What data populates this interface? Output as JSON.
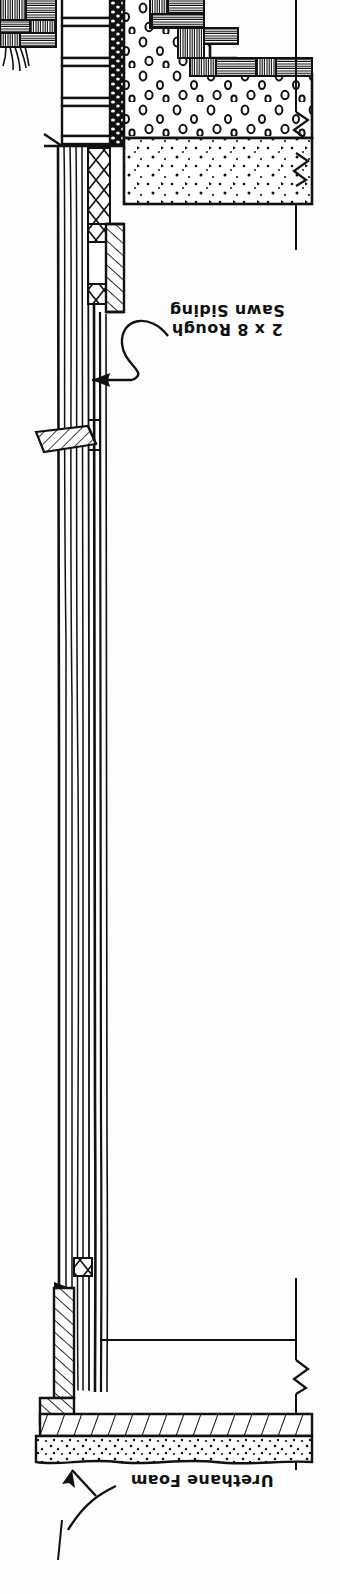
{
  "drawing": {
    "type": "architectural-wall-section",
    "title": "Wall Section Detail",
    "orientation": "inverted",
    "paper_color": "#fdfdfd",
    "ink_color": "#111111"
  },
  "annotations": [
    {
      "id": "siding",
      "lines": [
        "2 x 8 Rough",
        "Sawn Siding"
      ],
      "line1": "2 x 8 Rough",
      "line2": "Sawn Siding",
      "rotation_deg": 180,
      "leader": "s-curve-with-arrowhead",
      "points_to": "rough-sawn-siding-boards"
    },
    {
      "id": "foam",
      "lines": [
        "Urethane Foam"
      ],
      "line1": "Urethane Foam",
      "rotation_deg": 180,
      "leader": "two-stroke-arrow",
      "points_to": "urethane-foam-layer"
    }
  ],
  "materials": {
    "wood_section": "wood-grain-hatch",
    "concrete": "aggregate-dot-fill",
    "sand_fill": "fine-speckle-fill",
    "insulation_batt": "x-cross-hatch",
    "rigid_board": "diagonal-hatch",
    "foam": "dense-speckle-fill",
    "mortar_strip": "irregular-dash-fill"
  },
  "symbols": {
    "break_line": "zigzag-break",
    "break_count": 3
  }
}
